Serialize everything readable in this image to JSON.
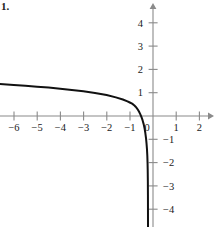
{
  "figure": {
    "problem_number": "1.",
    "axis_color": "#8a8a8a",
    "curve_color": "#111111",
    "label_color": "#1a1a1a"
  },
  "chart_data": {
    "type": "line",
    "title": "",
    "subtitle": "",
    "xlabel": "",
    "ylabel": "",
    "xlim": [
      -6.6,
      2.6
    ],
    "ylim": [
      -4.8,
      4.7
    ],
    "grid": false,
    "legend": null,
    "annotations": [],
    "x_ticks": [
      -6,
      -5,
      -4,
      -3,
      -2,
      -1,
      0,
      1,
      2
    ],
    "x_tick_labels": [
      "−6",
      "−5",
      "−4",
      "−3",
      "−2",
      "−1",
      "0",
      "1",
      "2"
    ],
    "y_ticks": [
      -4,
      -3,
      -2,
      -1,
      1,
      2,
      3,
      4
    ],
    "y_tick_labels": [
      "−4",
      "−3",
      "−2",
      "−1",
      "1",
      "2",
      "3",
      "4"
    ],
    "x_axis_arrow": "right",
    "y_axis_arrow": "up",
    "vertical_asymptote": -0.2,
    "x_intercept": -0.75,
    "series": [
      {
        "name": "curve",
        "x": [
          -6.6,
          -6.0,
          -5.5,
          -5.0,
          -4.5,
          -4.0,
          -3.5,
          -3.0,
          -2.5,
          -2.0,
          -1.6,
          -1.3,
          -1.1,
          -1.0,
          -0.9,
          -0.8,
          -0.75,
          -0.7,
          -0.65,
          -0.6,
          -0.55,
          -0.5,
          -0.45,
          -0.4,
          -0.36,
          -0.33,
          -0.3,
          -0.28,
          -0.26,
          -0.245,
          -0.235,
          -0.228,
          -0.222,
          -0.218,
          -0.215
        ],
        "y": [
          1.37,
          1.33,
          1.3,
          1.26,
          1.22,
          1.17,
          1.12,
          1.06,
          0.99,
          0.9,
          0.8,
          0.71,
          0.63,
          0.58,
          0.53,
          0.45,
          0.4,
          0.34,
          0.27,
          0.18,
          0.08,
          -0.04,
          -0.18,
          -0.36,
          -0.55,
          -0.73,
          -0.96,
          -1.16,
          -1.42,
          -1.7,
          -2.0,
          -2.32,
          -2.8,
          -3.4,
          -4.8
        ]
      }
    ]
  }
}
